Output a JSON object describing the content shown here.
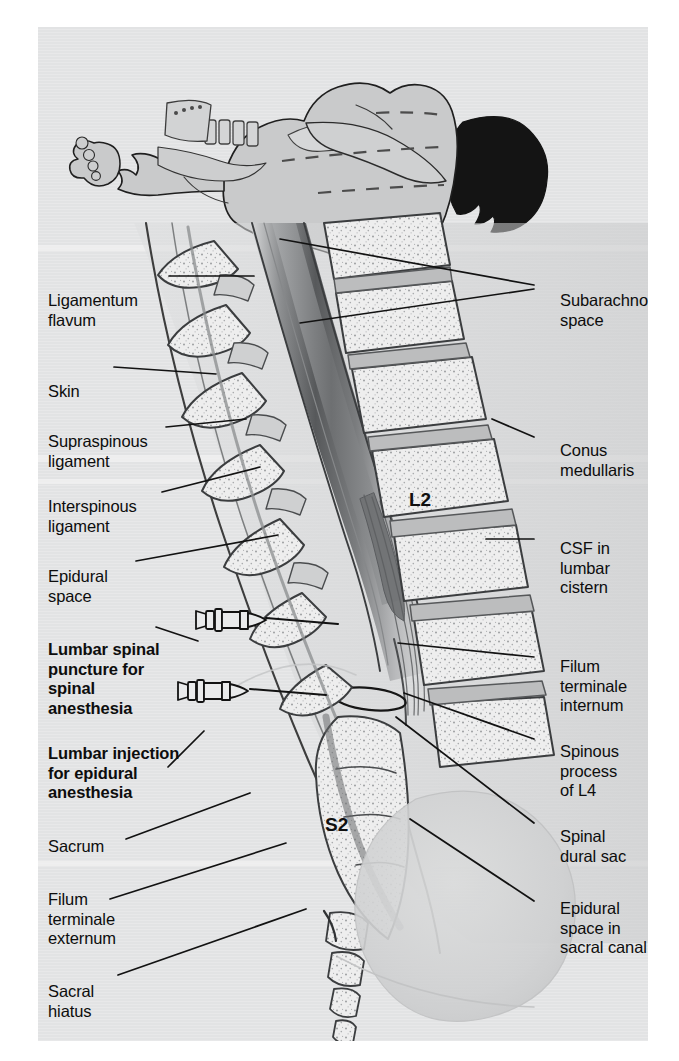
{
  "figure": {
    "kind": "medical-illustration",
    "panel_background": "#e3e4e5",
    "ink_color": "#1a1a1a",
    "page_background": "#ffffff"
  },
  "top_panel": {
    "name": "patient-positioning-figure",
    "description": "Patient in lateral decubitus position with spine flexed, knees drawn up, dark hair at right",
    "hair_color": "#141414",
    "body_fill": "#c9cacb",
    "drape_fill": "#d6d7d8"
  },
  "labels_left": [
    {
      "id": "ligamentum-flavum",
      "text": "Ligamentum\nflavum",
      "bold": false,
      "x": 10,
      "y": 264
    },
    {
      "id": "skin",
      "text": "Skin",
      "bold": false,
      "x": 10,
      "y": 355
    },
    {
      "id": "supraspinous-ligament",
      "text": "Supraspinous\nligament",
      "bold": false,
      "x": 10,
      "y": 405
    },
    {
      "id": "interspinous-ligament",
      "text": "Interspinous\nligament",
      "bold": false,
      "x": 10,
      "y": 470
    },
    {
      "id": "epidural-space",
      "text": "Epidural\nspace",
      "bold": false,
      "x": 10,
      "y": 540
    },
    {
      "id": "lumbar-spinal-puncture",
      "text": "Lumbar spinal\npuncture for\nspinal\nanesthesia",
      "bold": true,
      "x": 10,
      "y": 613
    },
    {
      "id": "lumbar-epidural-injection",
      "text": "Lumbar injection\nfor epidural\nanesthesia",
      "bold": true,
      "x": 10,
      "y": 717
    },
    {
      "id": "sacrum",
      "text": "Sacrum",
      "bold": false,
      "x": 10,
      "y": 810
    },
    {
      "id": "filum-terminale-externum",
      "text": "Filum\nterminale\nexternum",
      "bold": false,
      "x": 10,
      "y": 863
    },
    {
      "id": "sacral-hiatus",
      "text": "Sacral\nhiatus",
      "bold": false,
      "x": 10,
      "y": 955
    }
  ],
  "labels_right": [
    {
      "id": "subarachnoid-space",
      "text": "Subarachnoid\nspace",
      "bold": false,
      "x": 522,
      "y": 264
    },
    {
      "id": "conus-medullaris",
      "text": "Conus\nmedullaris",
      "bold": false,
      "x": 522,
      "y": 414
    },
    {
      "id": "csf-lumbar-cistern",
      "text": "CSF in\nlumbar\ncistern",
      "bold": false,
      "x": 522,
      "y": 512
    },
    {
      "id": "filum-terminale-internum",
      "text": "Filum\nterminale\ninternum",
      "bold": false,
      "x": 522,
      "y": 630
    },
    {
      "id": "spinous-process-l4",
      "text": "Spinous\nprocess\nof L4",
      "bold": false,
      "x": 522,
      "y": 715
    },
    {
      "id": "spinal-dural-sac",
      "text": "Spinal\ndural sac",
      "bold": false,
      "x": 522,
      "y": 800
    },
    {
      "id": "epidural-space-sacral-canal",
      "text": "Epidural\nspace in\nsacral canal",
      "bold": false,
      "x": 522,
      "y": 872
    }
  ],
  "vertebral_level_labels": [
    {
      "id": "level-l2",
      "text": "L2",
      "x": 409,
      "y": 472
    },
    {
      "id": "level-s2",
      "text": "S2",
      "x": 325,
      "y": 797
    }
  ],
  "needles": [
    {
      "id": "spinal-needle",
      "label_ref": "lumbar-spinal-puncture",
      "hub_x": 196,
      "hub_y": 627,
      "tip_x": 330,
      "tip_y": 633
    },
    {
      "id": "epidural-needle",
      "label_ref": "lumbar-epidural-injection",
      "hub_x": 178,
      "hub_y": 698,
      "tip_x": 312,
      "tip_y": 703
    }
  ],
  "anatomy_parts": [
    "skin-contour",
    "subcutaneous-tissue",
    "supraspinous-ligament",
    "interspinous-ligament",
    "ligamentum-flavum",
    "epidural-space",
    "dura-mater",
    "subarachnoid-space",
    "spinal-cord",
    "conus-medullaris",
    "cauda-equina",
    "filum-terminale-internum",
    "filum-terminale-externum",
    "vertebral-bodies",
    "intervertebral-discs",
    "spinous-processes",
    "sacrum",
    "coccyx",
    "sacral-hiatus",
    "bladder-shadow"
  ]
}
